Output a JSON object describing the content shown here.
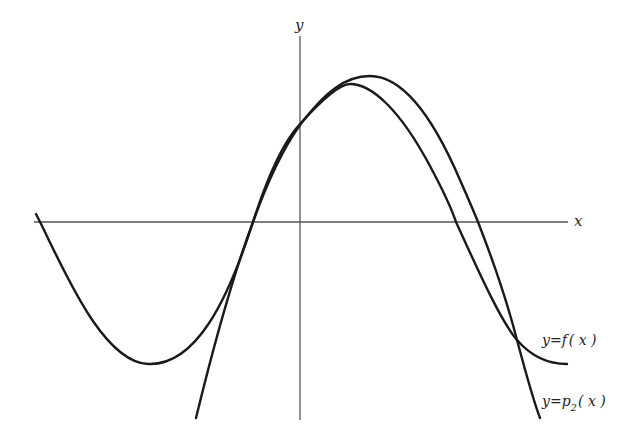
{
  "diagram": {
    "type": "function-approximation-plot",
    "axes": {
      "x_label": "x",
      "y_label": "y",
      "x_axis_y_px": 222,
      "y_axis_x_px": 300
    },
    "curves": [
      {
        "id": "f",
        "label_prefix": "y=f",
        "label_suffix": "( x )",
        "label_full": "y=f(x)",
        "description": "cubic-like curve: starts top-left above x-axis, dips to local minimum, rises to a maximum, then descends and levels off at bottom-right"
      },
      {
        "id": "p2",
        "label_prefix": "y=p",
        "label_subscript": "2",
        "label_suffix": "( x )",
        "label_full": "y=p2(x)",
        "description": "downward-opening parabola approximating f near the origin"
      }
    ],
    "features": {
      "f_local_min_px": [
        148,
        364
      ],
      "f_max_px": [
        350,
        84
      ],
      "p2_vertex_px": [
        370,
        76
      ],
      "x_intercepts_near_origin_px": [
        253,
        222
      ],
      "f_right_root_px": [
        456,
        222
      ],
      "p2_right_root_px": [
        478,
        222
      ],
      "curves_crossing_px": [
        517,
        340
      ]
    }
  }
}
